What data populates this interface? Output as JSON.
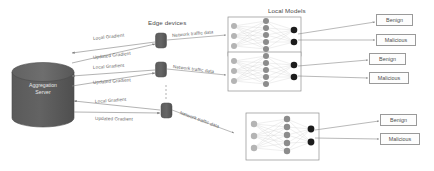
{
  "diagram": {
    "background": "#ffffff",
    "colors": {
      "server_fill": "#595959",
      "server_stroke": "#4a4a4a",
      "server_text": "#eaeaea",
      "edge_device_fill": "#5e5e5e",
      "box_stroke": "#8f8f8f",
      "arrow": "#7d7d7d",
      "label_text": "#5a5a5a",
      "node_input": "#b4b4b4",
      "node_hidden": "#8c8c8c",
      "node_output": "#1c1c1c",
      "edge_line": "#cfcfcf"
    },
    "server": {
      "name": "aggregation-server",
      "label_line1": "Aggregation",
      "label_line2": "Server"
    },
    "section_labels": {
      "edge_devices": "Edge devices",
      "local_models": "Local Models"
    },
    "flows": [
      {
        "id": "flow-1",
        "up_label": "Local Gradient",
        "down_label": "Updated Gradient",
        "data_label": "Network traffic data"
      },
      {
        "id": "flow-2",
        "up_label": "Local Gradient",
        "down_label": "Updated Gradient",
        "data_label": "Network traffic data"
      },
      {
        "id": "flow-3",
        "up_label": "Local Gradient",
        "down_label": "Updated Gradient",
        "data_label": "Network traffic data"
      }
    ],
    "edge_devices": [
      {
        "id": "edge-device-1",
        "name": "edge-device"
      },
      {
        "id": "edge-device-2",
        "name": "edge-device"
      },
      {
        "id": "edge-device-3",
        "name": "edge-device"
      }
    ],
    "ellipsis": "⋮",
    "local_models": [
      {
        "id": "local-model-1",
        "layers": {
          "input": 3,
          "hidden": 5,
          "output": 2
        },
        "outputs": [
          "Benign",
          "Malicious"
        ]
      },
      {
        "id": "local-model-2",
        "layers": {
          "input": 3,
          "hidden": 5,
          "output": 2
        },
        "outputs": [
          "Benign",
          "Malicious"
        ]
      },
      {
        "id": "local-model-3",
        "layers": {
          "input": 3,
          "hidden": 5,
          "output": 2
        },
        "outputs": [
          "Benign",
          "Malicious"
        ]
      }
    ],
    "classification_labels": {
      "benign": "Benign",
      "malicious": "Malicious"
    }
  }
}
